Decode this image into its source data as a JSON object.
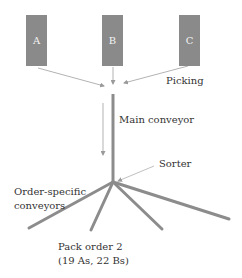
{
  "diagram": {
    "type": "order-picking-sorter-flow",
    "bins": [
      {
        "id": "A",
        "label": "A"
      },
      {
        "id": "B",
        "label": "B"
      },
      {
        "id": "C",
        "label": "C"
      }
    ],
    "labels": {
      "picking": "Picking",
      "main_conveyor": "Main conveyor",
      "sorter": "Sorter",
      "order_specific_line1": "Order-specific",
      "order_specific_line2": "conveyors",
      "pack_order_line1": "Pack order 2",
      "pack_order_line2": "(19 As, 22 Bs)"
    },
    "colors": {
      "bin_fill": "#8a8a8a",
      "conveyor": "#8c8c8c",
      "arrow": "#b0b0b0",
      "text": "#333333"
    },
    "branches": 4
  }
}
